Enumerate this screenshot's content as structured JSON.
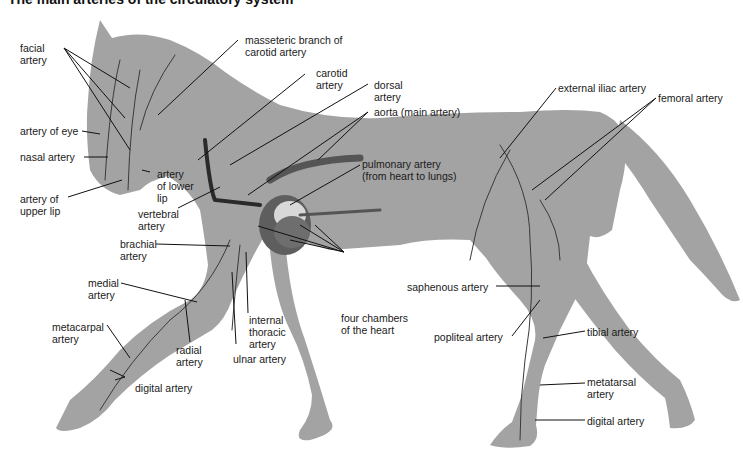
{
  "title": "The main arteries of the circulatory system",
  "colors": {
    "horse_fill": "#a3a3a3",
    "artery": "#3a3a3a",
    "heart": "#5e5e5e",
    "background": "#ffffff"
  },
  "labels": {
    "facial": [
      "facial",
      "artery"
    ],
    "eye": [
      "artery of eye"
    ],
    "nasal": [
      "nasal artery"
    ],
    "upper_lip": [
      "artery of",
      "upper lip"
    ],
    "lower_lip": [
      "artery",
      "of lower",
      "lip"
    ],
    "masseteric": [
      "masseteric branch of",
      "carotid artery"
    ],
    "carotid": [
      "carotid",
      "artery"
    ],
    "dorsal": [
      "dorsal",
      "artery"
    ],
    "aorta": [
      "aorta (main artery)"
    ],
    "pulmonary": [
      "pulmonary artery",
      "(from heart to lungs)"
    ],
    "vertebral": [
      "vertebral",
      "artery"
    ],
    "brachial": [
      "brachial",
      "artery"
    ],
    "medial": [
      "medial",
      "artery"
    ],
    "metacarpal": [
      "metacarpal",
      "artery"
    ],
    "radial": [
      "radial",
      "artery"
    ],
    "internal_thoracic": [
      "internal",
      "thoracic",
      "artery"
    ],
    "ulnar": [
      "ulnar artery"
    ],
    "digital_front": [
      "digital artery"
    ],
    "four_chambers": [
      "four chambers",
      "of the heart"
    ],
    "external_iliac": [
      "external iliac artery"
    ],
    "femoral": [
      "femoral artery"
    ],
    "saphenous": [
      "saphenous artery"
    ],
    "popliteal": [
      "popliteal artery"
    ],
    "tibial": [
      "tibial artery"
    ],
    "metatarsal": [
      "metatarsal",
      "artery"
    ],
    "digital_hind": [
      "digital artery"
    ]
  }
}
